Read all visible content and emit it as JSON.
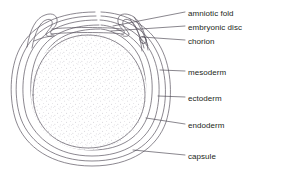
{
  "figure": {
    "background_color": "#ffffff",
    "line_color": "#5a5560",
    "stipple_color": "#b9b6bf",
    "text_color": "#231f20"
  },
  "labels": [
    {
      "id": "amniotic-fold",
      "text": "amniotic fold",
      "x": 188,
      "y": 9,
      "leader_from_x": 113,
      "leader_from_y": 26,
      "leader_to_x": 185,
      "leader_to_y": 12
    },
    {
      "id": "embryonic-disc",
      "text": "embryonic disc",
      "x": 188,
      "y": 23,
      "leader_from_x": 111,
      "leader_from_y": 31,
      "leader_to_x": 185,
      "leader_to_y": 26
    },
    {
      "id": "chorion",
      "text": "chorion",
      "x": 188,
      "y": 37,
      "leader_from_x": 142,
      "leader_from_y": 37,
      "leader_to_x": 185,
      "leader_to_y": 40
    },
    {
      "id": "mesoderm",
      "text": "mesoderm",
      "x": 188,
      "y": 68,
      "leader_from_x": 160,
      "leader_from_y": 70,
      "leader_to_x": 185,
      "leader_to_y": 71
    },
    {
      "id": "ectoderm",
      "text": "ectoderm",
      "x": 188,
      "y": 94,
      "leader_from_x": 158,
      "leader_from_y": 96,
      "leader_to_x": 185,
      "leader_to_y": 97
    },
    {
      "id": "endoderm",
      "text": "endoderm",
      "x": 188,
      "y": 121,
      "leader_from_x": 146,
      "leader_from_y": 118,
      "leader_to_x": 185,
      "leader_to_y": 124
    },
    {
      "id": "capsule",
      "text": "capsule",
      "x": 188,
      "y": 152,
      "leader_from_x": 133,
      "leader_from_y": 150,
      "leader_to_x": 185,
      "leader_to_y": 155
    }
  ],
  "structures": [
    {
      "id": "capsule-outer",
      "name": "capsule outer wall"
    },
    {
      "id": "capsule-inner",
      "name": "capsule inner wall"
    },
    {
      "id": "chorion-layer",
      "name": "chorion membrane"
    },
    {
      "id": "mesoderm-layer",
      "name": "mesoderm layer"
    },
    {
      "id": "ectoderm-layer",
      "name": "ectoderm layer"
    },
    {
      "id": "endoderm-layer",
      "name": "endoderm layer"
    },
    {
      "id": "yolk-mass",
      "name": "stippled yolk mass"
    },
    {
      "id": "amniotic-fold-left",
      "name": "left amniotic fold"
    },
    {
      "id": "amniotic-fold-right",
      "name": "right amniotic fold"
    },
    {
      "id": "embryonic-disc-band",
      "name": "embryonic disc band"
    }
  ]
}
